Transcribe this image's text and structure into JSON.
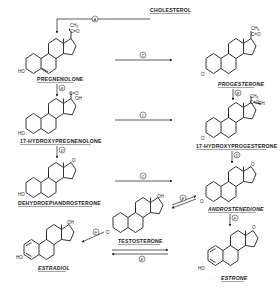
{
  "start": {
    "label": "CHOLESTEROL"
  },
  "compounds": {
    "pregnenolone": {
      "label": "PREGNENOLONE"
    },
    "progesterone": {
      "label": "PROGESTERONE"
    },
    "hydroxypregnenolone": {
      "label": "17-HYDROXYPREGNENOLONE"
    },
    "hydroxyprogesterone": {
      "label": "17-HYDROXYPROGESTERONE"
    },
    "dhea": {
      "label": "DEHYDROEPIANDROSTERONE"
    },
    "androstenedione": {
      "label": "ANDROSTENEDIONE"
    },
    "testosterone": {
      "label": "TESTOSTERONE"
    },
    "estradiol": {
      "label": "ESTRADIOL"
    },
    "estrone": {
      "label": "ESTRONE"
    }
  },
  "substituents": {
    "ho": "HO",
    "o": "O",
    "oh": "OH",
    "ch3": "CH₃",
    "co": "C=O",
    "ooh": "---OH"
  },
  "enzymes": {
    "a": "A",
    "b": "B",
    "c": "C",
    "d": "D",
    "e": "E",
    "f": "F"
  }
}
